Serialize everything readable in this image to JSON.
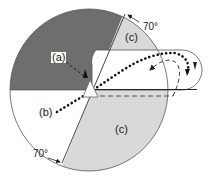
{
  "diagram": {
    "labels": {
      "a": "(a)",
      "b": "(b)",
      "c_top": "(c)",
      "c_bottom": "(c)",
      "angle_top": "70°",
      "angle_bottom": "70°"
    },
    "colors": {
      "dark_region": "#6e6e6e",
      "light_region": "#d9d9d9",
      "white_region": "#ffffff",
      "outline": "#333333"
    },
    "elements": [
      "circle divided into regions",
      "dark gray upper-left region",
      "light gray region (c) top right",
      "light gray region (c) bottom",
      "white cutout lobe extending right",
      "triangle marker at center",
      "dashed arrow (a)",
      "dotted path (b)",
      "70° angle arcs"
    ]
  }
}
